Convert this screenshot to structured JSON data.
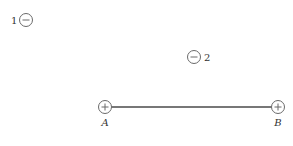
{
  "diagram": {
    "charges": [
      {
        "id": "charge-1",
        "label": "1",
        "sign": "negative",
        "sign_glyph": "−"
      },
      {
        "id": "charge-2",
        "label": "2",
        "sign": "negative",
        "sign_glyph": "−"
      },
      {
        "id": "charge-A",
        "label": "A",
        "sign": "positive",
        "sign_glyph": "+"
      },
      {
        "id": "charge-B",
        "label": "B",
        "sign": "positive",
        "sign_glyph": "+"
      }
    ],
    "connections": [
      {
        "from": "A",
        "to": "B",
        "type": "rod"
      }
    ],
    "colors": {
      "circle_stroke": "#6a6a6a",
      "rod": "#4a4a4a",
      "text": "#333333",
      "background": "#ffffff"
    }
  }
}
